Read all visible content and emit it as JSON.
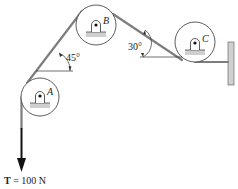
{
  "diagram": {
    "type": "pulley-system",
    "pulleys": [
      {
        "id": "A",
        "label": "A",
        "cx": 40,
        "cy": 97,
        "r": 19
      },
      {
        "id": "B",
        "label": "B",
        "cx": 96,
        "cy": 25,
        "r": 20
      },
      {
        "id": "C",
        "label": "C",
        "cx": 195,
        "cy": 42,
        "r": 20
      }
    ],
    "angles": [
      {
        "label": "45°",
        "at": "between A and B"
      },
      {
        "label": "30°",
        "at": "between B and C"
      }
    ],
    "force": {
      "label": "T = 100 N",
      "symbol": "T",
      "value": "100 N",
      "direction": "down"
    },
    "colors": {
      "rope": "#8a8a8a",
      "line": "#222222",
      "support": "#c8c8c8"
    }
  }
}
